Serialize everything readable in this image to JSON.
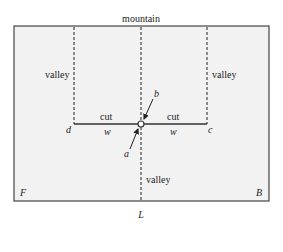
{
  "diagram": {
    "title": "mountain",
    "paper_fill": "#f2f2f2",
    "line_color": "#333333",
    "folds": {
      "left_valley": "valley",
      "right_valley": "valley",
      "center_valley": "valley"
    },
    "cuts": {
      "left_cut": "cut",
      "right_cut": "cut"
    },
    "points": {
      "d": "d",
      "c": "c",
      "a": "a",
      "b": "b"
    },
    "widths": {
      "left_w": "w",
      "right_w": "w"
    },
    "corners": {
      "front": "F",
      "back": "B",
      "bottom": "L"
    }
  }
}
